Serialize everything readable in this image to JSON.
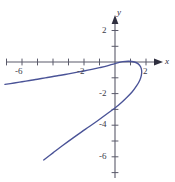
{
  "chart_data": {
    "type": "line",
    "title": "",
    "xlabel": "x",
    "ylabel": "y",
    "xlim": [
      -7.2,
      3.1
    ],
    "ylim": [
      -7.2,
      2.6
    ],
    "grid": false,
    "legend": null,
    "axis_style": "arrowed-cartesian-axes",
    "curve_color": "#4a5397",
    "axis_color": "#5a5a6a",
    "xticks": [
      -6,
      -2,
      2
    ],
    "xtick_labels": [
      "-6",
      "-2",
      "2"
    ],
    "xticks_unlabeled": [
      -7,
      -5,
      -4,
      -3,
      -1,
      1,
      3
    ],
    "yticks": [
      2,
      -2,
      -4,
      -6
    ],
    "ytick_labels": [
      "2",
      "-2",
      "-4",
      "-6"
    ],
    "yticks_unlabeled": [
      1,
      -1,
      -3,
      -5,
      -7
    ],
    "series": [
      {
        "name": "sideways-parabola",
        "x": [
          -7.1,
          -6.5,
          -6.0,
          -5.5,
          -5.0,
          -4.5,
          -4.0,
          -3.5,
          -3.0,
          -2.5,
          -2.0,
          -1.5,
          -1.0,
          -0.5,
          0.0,
          0.5,
          0.9,
          1.25,
          1.5,
          1.65,
          1.72,
          1.7,
          1.6,
          1.4,
          1.1,
          0.7,
          0.2,
          -0.4,
          -1.1,
          -1.9,
          -2.7,
          -3.4,
          -4.0,
          -4.6
        ],
        "y": [
          -1.42,
          -1.33,
          -1.25,
          -1.17,
          -1.09,
          -1.0,
          -0.92,
          -0.84,
          -0.75,
          -0.66,
          -0.57,
          -0.47,
          -0.36,
          -0.24,
          -0.1,
          0.02,
          0.05,
          0.0,
          -0.12,
          -0.3,
          -0.55,
          -0.85,
          -1.15,
          -1.5,
          -1.9,
          -2.3,
          -2.75,
          -3.2,
          -3.7,
          -4.25,
          -4.8,
          -5.3,
          -5.75,
          -6.2
        ]
      }
    ]
  },
  "axis_labels": {
    "x": "x",
    "y": "y"
  },
  "tick_text": {
    "x_neg6": "-6",
    "x_neg2": "-2",
    "x_pos2": "2",
    "y_pos2": "2",
    "y_neg2": "-2",
    "y_neg4": "-4",
    "y_neg6": "-6"
  }
}
